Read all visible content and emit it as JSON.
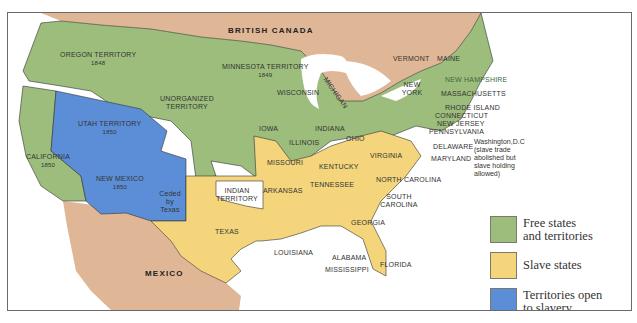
{
  "colors": {
    "free": "#9dbd7c",
    "slave": "#f4d57c",
    "open_territory": "#5b8ed6",
    "foreign": "#dfb796",
    "water": "#ffffff",
    "indian_territory": "#ffffff",
    "border": "#333333"
  },
  "regions": {
    "british_canada": "BRITISH CANADA",
    "mexico": "MEXICO",
    "oregon": {
      "name": "OREGON TERRITORY",
      "year": "1848"
    },
    "minnesota": {
      "name": "MINNESOTA TERRITORY",
      "year": "1849"
    },
    "unorganized": "UNORGANIZED TERRITORY",
    "utah": {
      "name": "UTAH TERRITORY",
      "year": "1850"
    },
    "california": {
      "name": "CALIFORNIA",
      "year": "1850"
    },
    "new_mexico": {
      "name": "NEW MEXICO",
      "year": "1850"
    },
    "ceded_by_texas": "Ceded by Texas",
    "indian_territory": "INDIAN TERRITORY",
    "texas": "TEXAS",
    "wisconsin": "WISCONSIN",
    "michigan": "MICHIGAN",
    "iowa": "IOWA",
    "illinois": "ILLINOIS",
    "indiana": "INDIANA",
    "ohio": "OHIO",
    "missouri": "MISSOURI",
    "kentucky": "KENTUCKY",
    "virginia": "VIRGINIA",
    "arkansas": "ARKANSAS",
    "tennessee": "TENNESSEE",
    "north_carolina": "NORTH CAROLINA",
    "south_carolina": "SOUTH CAROLINA",
    "georgia": "GEORGIA",
    "louisiana": "LOUISIANA",
    "alabama": "ALABAMA",
    "mississippi": "MISSISSIPPI",
    "florida": "FLORIDA",
    "vermont": "VERMONT",
    "maine": "MAINE",
    "new_york": "NEW YORK",
    "new_hampshire": "NEW HAMPSHIRE",
    "massachusetts": "MASSACHUSETTS",
    "rhode_island": "RHODE ISLAND",
    "connecticut": "CONNECTICUT",
    "new_jersey": "NEW JERSEY",
    "pennsylvania": "PENNSYLVANIA",
    "delaware": "DELAWARE",
    "maryland": "MARYLAND",
    "washington_dc_note": "Washington,D.C\n(slave trade\nabolished but\nslave holding\nallowed)"
  },
  "legend": [
    {
      "label": "Free states\nand territories",
      "color": "#9dbd7c"
    },
    {
      "label": "Slave states",
      "color": "#f4d57c"
    },
    {
      "label": "Territories open\nto slavery",
      "color": "#5b8ed6"
    }
  ]
}
